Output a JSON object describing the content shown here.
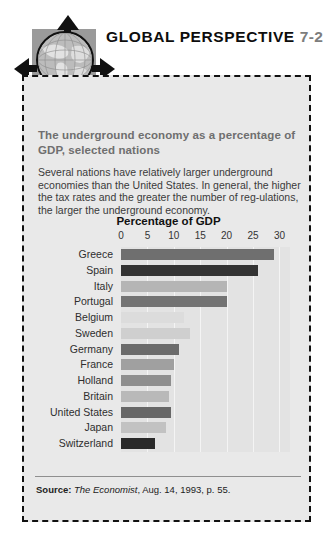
{
  "header": {
    "title": "GLOBAL PERSPECTIVE",
    "number": "7-2",
    "icon": "globe-icon"
  },
  "box": {
    "heading": "The underground economy as a percentage of GDP, selected nations",
    "body": "Several nations have relatively larger underground economies than the United States. In general, the higher the tax rates and the greater the number of reg-ulations, the larger the underground economy."
  },
  "source": {
    "label": "Source:",
    "publication": "The Economist",
    "rest": ", Aug. 14, 1993, p. 55."
  },
  "colors": {
    "box_bg": "#e9e9e9",
    "plot_bg": "#e3e3e3",
    "gridline": "#f4f4f4",
    "heading": "#6f6f6f",
    "title": "#0d0d0d",
    "number": "#7d7d7d"
  },
  "chart_data": {
    "type": "bar",
    "orientation": "horizontal",
    "title": "Percentage of GDP",
    "xlabel": "Percentage of GDP",
    "ylabel": "",
    "xlim": [
      0,
      32
    ],
    "ticks": [
      0,
      5,
      10,
      15,
      20,
      25,
      30
    ],
    "grid": true,
    "legend": false,
    "categories": [
      "Greece",
      "Spain",
      "Italy",
      "Portugal",
      "Belgium",
      "Sweden",
      "Germany",
      "France",
      "Holland",
      "Britain",
      "United States",
      "Japan",
      "Switzerland"
    ],
    "values": [
      29,
      26,
      20,
      20,
      12,
      13,
      11,
      10,
      9.5,
      9,
      9.5,
      8.5,
      6.5
    ],
    "bar_colors": [
      "#6f6f6f",
      "#333333",
      "#b5b5b5",
      "#737373",
      "#dcdcdc",
      "#cfcfcf",
      "#6b6b6b",
      "#a0a0a0",
      "#8e8e8e",
      "#b9b9b9",
      "#676767",
      "#c2c2c2",
      "#2a2a2a"
    ]
  }
}
